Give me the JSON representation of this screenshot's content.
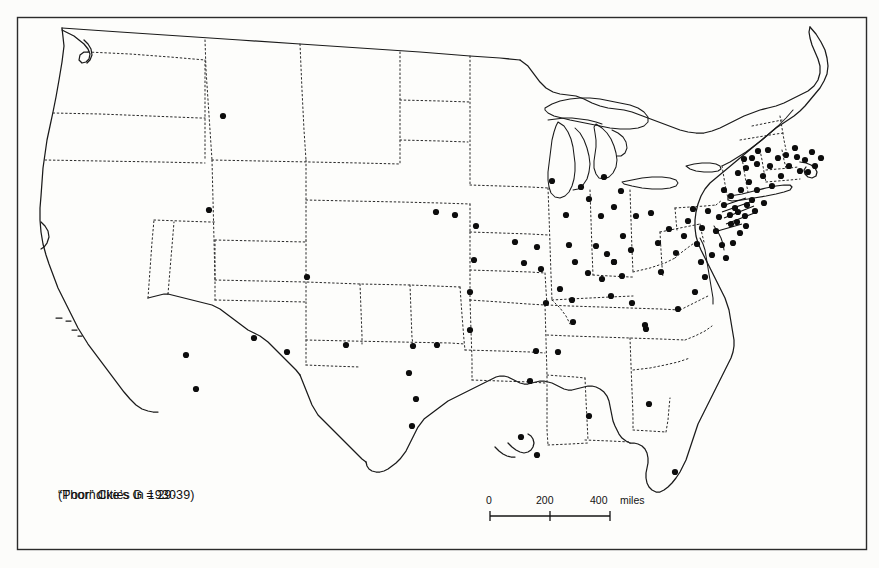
{
  "figure": {
    "kind": "thematic-dot-map",
    "region": "contiguous United States",
    "background_color": "#fcfcfa",
    "frame_color": "#2b2b2b",
    "ink_color": "#111111"
  },
  "caption": {
    "line1": "“Poor” Cities in 1930",
    "line2": "(Thorndike’s G = 29·39)"
  },
  "scale_bar": {
    "tick_0": "0",
    "tick_200": "200",
    "tick_400": "400",
    "units": "miles"
  },
  "map_data": {
    "type": "dot-map",
    "symbol": "filled-circle",
    "symbol_meaning": "one “poor” city in 1930",
    "state_border_style": "dotted",
    "coastline_style": "solid",
    "great_lakes_drawn": true,
    "dot_count_approx": 120,
    "density_notes": [
      "Very dense cluster in New England, New York, New Jersey and Pennsylvania",
      "Moderate density across Ohio, Indiana, Illinois and Michigan",
      "Sparse across the Great Plains and Mountain West",
      "Very few dots in the Deep South",
      "Isolated dots in Texas, Oklahoma, Arizona, New Mexico, California and Florida"
    ],
    "dots": [
      [
        223,
        116
      ],
      [
        209,
        210
      ],
      [
        307,
        277
      ],
      [
        186,
        355
      ],
      [
        196,
        389
      ],
      [
        254,
        338
      ],
      [
        287,
        352
      ],
      [
        346,
        345
      ],
      [
        413,
        346
      ],
      [
        416,
        399
      ],
      [
        412,
        426
      ],
      [
        409,
        373
      ],
      [
        437,
        345
      ],
      [
        470,
        292
      ],
      [
        474,
        260
      ],
      [
        436,
        212
      ],
      [
        455,
        215
      ],
      [
        476,
        226
      ],
      [
        521,
        437
      ],
      [
        470,
        330
      ],
      [
        524,
        263
      ],
      [
        537,
        247
      ],
      [
        541,
        269
      ],
      [
        515,
        242
      ],
      [
        552,
        181
      ],
      [
        566,
        215
      ],
      [
        569,
        245
      ],
      [
        560,
        289
      ],
      [
        573,
        322
      ],
      [
        575,
        262
      ],
      [
        546,
        303
      ],
      [
        536,
        351
      ],
      [
        558,
        352
      ],
      [
        581,
        187
      ],
      [
        589,
        199
      ],
      [
        604,
        177
      ],
      [
        601,
        216
      ],
      [
        596,
        246
      ],
      [
        607,
        254
      ],
      [
        614,
        262
      ],
      [
        623,
        236
      ],
      [
        631,
        250
      ],
      [
        622,
        276
      ],
      [
        611,
        296
      ],
      [
        632,
        303
      ],
      [
        645,
        325
      ],
      [
        661,
        272
      ],
      [
        658,
        243
      ],
      [
        669,
        229
      ],
      [
        651,
        213
      ],
      [
        636,
        216
      ],
      [
        614,
        207
      ],
      [
        602,
        279
      ],
      [
        588,
        273
      ],
      [
        572,
        300
      ],
      [
        621,
        191
      ],
      [
        676,
        253
      ],
      [
        684,
        236
      ],
      [
        688,
        221
      ],
      [
        697,
        244
      ],
      [
        702,
        228
      ],
      [
        693,
        209
      ],
      [
        708,
        211
      ],
      [
        716,
        231
      ],
      [
        722,
        245
      ],
      [
        712,
        255
      ],
      [
        701,
        262
      ],
      [
        726,
        258
      ],
      [
        733,
        243
      ],
      [
        719,
        217
      ],
      [
        731,
        224
      ],
      [
        740,
        233
      ],
      [
        724,
        205
      ],
      [
        735,
        208
      ],
      [
        745,
        216
      ],
      [
        752,
        200
      ],
      [
        741,
        190
      ],
      [
        731,
        196
      ],
      [
        724,
        190
      ],
      [
        749,
        182
      ],
      [
        757,
        190
      ],
      [
        763,
        176
      ],
      [
        770,
        166
      ],
      [
        757,
        164
      ],
      [
        746,
        168
      ],
      [
        738,
        173
      ],
      [
        772,
        186
      ],
      [
        781,
        176
      ],
      [
        789,
        166
      ],
      [
        797,
        157
      ],
      [
        805,
        160
      ],
      [
        812,
        152
      ],
      [
        795,
        148
      ],
      [
        786,
        155
      ],
      [
        778,
        158
      ],
      [
        768,
        150
      ],
      [
        758,
        151
      ],
      [
        752,
        158
      ],
      [
        744,
        159
      ],
      [
        800,
        171
      ],
      [
        808,
        172
      ],
      [
        815,
        166
      ],
      [
        821,
        158
      ],
      [
        764,
        203
      ],
      [
        755,
        211
      ],
      [
        747,
        205
      ],
      [
        738,
        212
      ],
      [
        746,
        226
      ],
      [
        737,
        222
      ],
      [
        730,
        215
      ],
      [
        705,
        277
      ],
      [
        695,
        292
      ],
      [
        678,
        309
      ],
      [
        646,
        329
      ],
      [
        614,
        262
      ],
      [
        537,
        455
      ],
      [
        675,
        472
      ],
      [
        649,
        404
      ],
      [
        589,
        416
      ],
      [
        530,
        381
      ]
    ]
  }
}
